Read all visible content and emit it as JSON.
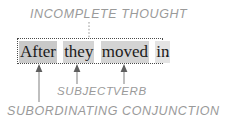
{
  "figure": {
    "type": "grammar-annotation-diagram",
    "caption_top": "INCOMPLETE THOUGHT",
    "caption_subject": "SUBJECT",
    "caption_verb": "VERB",
    "caption_subordinating_conjunction": "SUBORDINATING CONJUNCTION"
  },
  "sentence": {
    "full_text": "After they moved in",
    "trailing_punctuation": ".",
    "words": [
      {
        "text": "After",
        "highlight": "dark",
        "role": "subordinating conjunction"
      },
      {
        "text": "they",
        "highlight": "mid",
        "role": "subject"
      },
      {
        "text": "moved",
        "highlight": "mid",
        "role": "verb"
      },
      {
        "text": "in",
        "highlight": "lite",
        "role": "particle"
      }
    ]
  },
  "colors": {
    "text": "#1c1c1c",
    "annotation": "#9a9a9a",
    "box_border": "#4a4a4a",
    "arrow": "#6f6f6f",
    "highlight_dark": "#c9c9c9",
    "highlight_mid": "#d4d4d4",
    "highlight_light": "#e4e4e4",
    "background": "#ffffff"
  },
  "connectors": {
    "incomplete_thought_leader": "dotted vertical line from caption down to sentence box",
    "subordinating_conjunction_leader": "long vertical line from arrow down to bottom caption",
    "arrows": [
      {
        "points_to": "After",
        "label": "SUBORDINATING CONJUNCTION"
      },
      {
        "points_to": "they",
        "label": "SUBJECT"
      },
      {
        "points_to": "moved",
        "label": "VERB"
      }
    ]
  }
}
